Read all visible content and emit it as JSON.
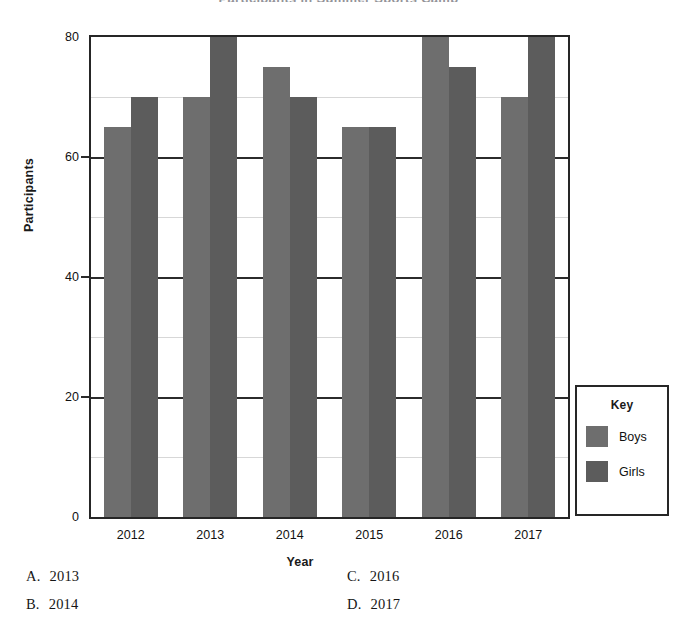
{
  "figure": {
    "title_sliver": "Participants in Summer Sports Camp",
    "ylabel": "Participants",
    "xlabel": "Year"
  },
  "legend": {
    "title": "Key",
    "entries": [
      {
        "label": "Boys",
        "color": "#6e6e6e"
      },
      {
        "label": "Girls",
        "color": "#5c5c5c"
      }
    ]
  },
  "axis": {
    "yticks": [
      "0",
      "20",
      "40",
      "60",
      "80"
    ],
    "xticks": [
      "2012",
      "2013",
      "2014",
      "2015",
      "2016",
      "2017"
    ]
  },
  "options": [
    {
      "letter": "A.",
      "text": "2013"
    },
    {
      "letter": "B.",
      "text": "2014"
    },
    {
      "letter": "C.",
      "text": "2016"
    },
    {
      "letter": "D.",
      "text": "2017"
    }
  ],
  "chart_data": {
    "type": "bar",
    "title": "Participants in Summer Sports Camp",
    "xlabel": "Year",
    "ylabel": "Participants",
    "categories": [
      "2012",
      "2013",
      "2014",
      "2015",
      "2016",
      "2017"
    ],
    "series": [
      {
        "name": "Boys",
        "color": "#6e6e6e",
        "values": [
          65,
          70,
          75,
          65,
          80,
          70
        ]
      },
      {
        "name": "Girls",
        "color": "#5c5c5c",
        "values": [
          70,
          80,
          70,
          65,
          75,
          80
        ]
      }
    ],
    "ylim": [
      0,
      80
    ],
    "ymajor_ticks": [
      0,
      20,
      40,
      60,
      80
    ],
    "yminor_gridlines": [
      10,
      30,
      50,
      70
    ],
    "grid": true,
    "legend_position": "right"
  }
}
